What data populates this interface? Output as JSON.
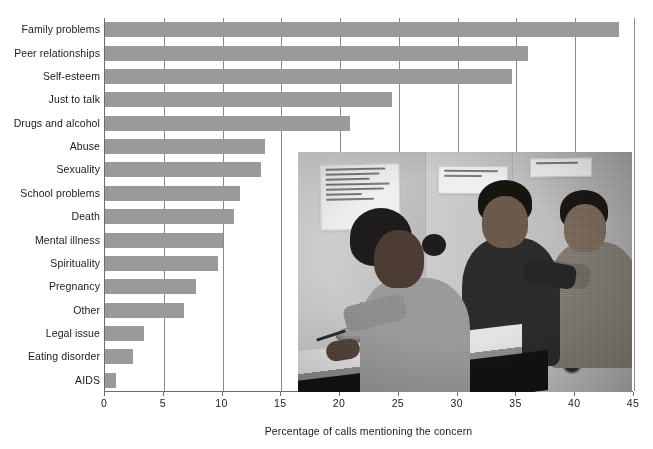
{
  "chart_data": {
    "type": "bar",
    "orientation": "horizontal",
    "title": "",
    "xlabel": "Percentage of calls mentioning the concern",
    "ylabel": "",
    "xlim": [
      0,
      45
    ],
    "xticks": [
      0,
      5,
      10,
      15,
      20,
      25,
      30,
      35,
      40,
      45
    ],
    "grid": true,
    "grid_axis": "x",
    "legend": false,
    "bar_color": "#9a9a9a",
    "axis_color": "#6d6d6d",
    "categories": [
      "Family problems",
      "Peer relationships",
      "Self-esteem",
      "Just to talk",
      "Drugs and alcohol",
      "Abuse",
      "Sexuality",
      "School problems",
      "Death",
      "Mental illness",
      "Spirituality",
      "Pregnancy",
      "Other",
      "Legal issue",
      "Eating disorder",
      "AIDS"
    ],
    "values": [
      43.7,
      36.0,
      34.6,
      24.4,
      20.8,
      13.6,
      13.3,
      11.5,
      11.0,
      10.0,
      9.6,
      7.7,
      6.7,
      3.3,
      2.4,
      0.9
    ]
  },
  "inset_photo": {
    "caption": "",
    "description": "Black and white photograph of three teenage volunteers seated at a crisis hotline phone bank, the nearest taking a call while handwritten posters are taped to the wall behind them",
    "color_mode": "black-and-white",
    "wall_signs": [
      "handwritten poem poster",
      "LISTEN WHEN I CALL — SAVE A LIFE!",
      "SUICIDE HOT LINE"
    ]
  }
}
